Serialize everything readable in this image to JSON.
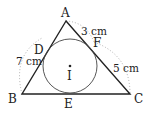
{
  "diagram": {
    "vertices": {
      "A": "A",
      "B": "B",
      "C": "C"
    },
    "tangent_points": {
      "D": "D",
      "E": "E",
      "F": "F"
    },
    "incenter": "I",
    "measurements": {
      "BD": "7 cm",
      "AF": "3 cm",
      "FC": "5 cm"
    }
  }
}
